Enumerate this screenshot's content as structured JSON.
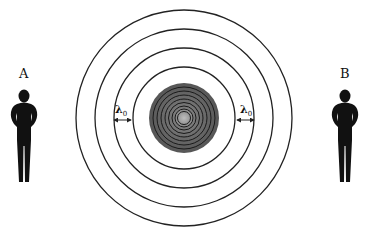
{
  "diagram": {
    "observers": [
      {
        "id": "A",
        "label": "A",
        "x": 24,
        "side": "left"
      },
      {
        "id": "B",
        "label": "B",
        "x": 344,
        "side": "right"
      }
    ],
    "source": {
      "center": [
        184,
        118
      ],
      "disc_radius": 35,
      "disc_color": "#555555",
      "inner_rings": 8
    },
    "wavefronts": {
      "radii": [
        51,
        70,
        89,
        108
      ],
      "stroke": "#222222"
    },
    "wavelength_markers": [
      {
        "label": "λ",
        "subscript": "0",
        "side": "left"
      },
      {
        "label": "λ",
        "subscript": "0",
        "side": "right"
      }
    ]
  }
}
